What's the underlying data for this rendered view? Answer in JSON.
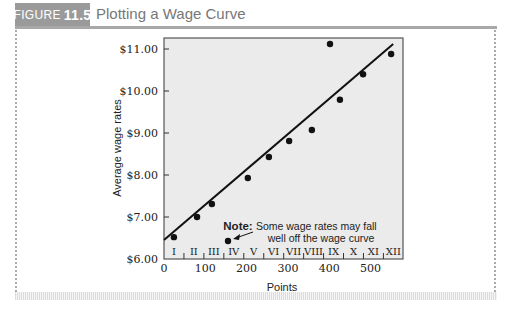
{
  "header": {
    "figure_label": "FIGURE",
    "figure_number": "11.5",
    "title": "Plotting a Wage Curve"
  },
  "chart_data": {
    "type": "scatter",
    "title": "Plotting a Wage Curve",
    "xlabel": "Points",
    "ylabel": "Average wage rates",
    "xlim": [
      0,
      580
    ],
    "ylim": [
      6.0,
      11.25
    ],
    "x_ticks": [
      0,
      100,
      200,
      300,
      400,
      500
    ],
    "y_ticks": [
      "$6.00",
      "$7.00",
      "$8.00",
      "$9.00",
      "$10.00",
      "$11.00"
    ],
    "grid": false,
    "grades": [
      "I",
      "II",
      "III",
      "IV",
      "V",
      "VI",
      "VII",
      "VIII",
      "IX",
      "X",
      "XI",
      "XII"
    ],
    "points": [
      {
        "x": 24,
        "y": 6.52
      },
      {
        "x": 80,
        "y": 7.0
      },
      {
        "x": 116,
        "y": 7.31
      },
      {
        "x": 155,
        "y": 6.43
      },
      {
        "x": 203,
        "y": 7.93
      },
      {
        "x": 254,
        "y": 8.43
      },
      {
        "x": 303,
        "y": 8.81
      },
      {
        "x": 358,
        "y": 9.07
      },
      {
        "x": 402,
        "y": 11.12
      },
      {
        "x": 426,
        "y": 9.79
      },
      {
        "x": 482,
        "y": 10.4
      },
      {
        "x": 550,
        "y": 10.88
      }
    ],
    "trend_line": {
      "x0": 0,
      "y0": 6.45,
      "x1": 555,
      "y1": 11.12
    },
    "annotation": {
      "bold": "Note:",
      "line1": "Some wage rates may fall",
      "line2": "well off the wage curve",
      "points_to": {
        "x": 155,
        "y": 6.43
      }
    }
  }
}
